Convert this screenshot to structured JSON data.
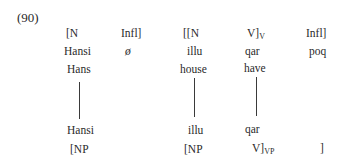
{
  "example": {
    "number": "(90)",
    "row1_labels": {
      "n1": "[N",
      "infl1": "Infl]",
      "nn": "[[N",
      "v_main": "V]",
      "v_sub": "V",
      "infl2": "Infl]"
    },
    "row2_morphemes": {
      "hansi": "Hansi",
      "null": "ø",
      "illu": "illu",
      "qar": "qar",
      "poq": "poq"
    },
    "row3_glosses": {
      "hans": "Hans",
      "house": "house",
      "have": "have"
    },
    "row4_morphemes": {
      "hansi": "Hansi",
      "illu": "illu",
      "qar": "qar"
    },
    "row5_labels": {
      "np1": "[NP",
      "np2": "[NP",
      "vp_main": "V]",
      "vp_sub": "VP",
      "close": "]"
    }
  }
}
